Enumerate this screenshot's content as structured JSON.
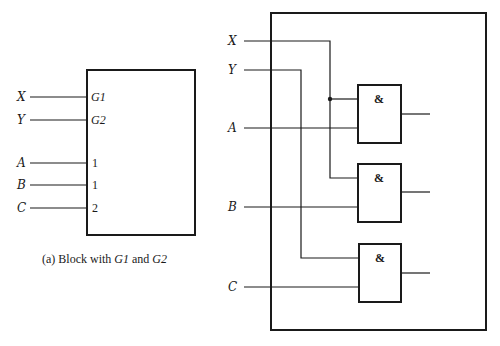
{
  "block_a": {
    "inputs": [
      {
        "label": "X",
        "pin": "G1",
        "pin_suffix": "1",
        "pin_prefix": "G"
      },
      {
        "label": "Y",
        "pin": "G2",
        "pin_suffix": "2",
        "pin_prefix": "G"
      },
      {
        "label": "A",
        "pin": "1"
      },
      {
        "label": "B",
        "pin": "1"
      },
      {
        "label": "C",
        "pin": "2"
      }
    ],
    "caption": {
      "prefix": "(a)  Block with ",
      "g1": "G1",
      "middle": " and ",
      "g2": "G2"
    }
  },
  "block_b": {
    "inputs": [
      {
        "label": "X"
      },
      {
        "label": "Y"
      },
      {
        "label": "A"
      },
      {
        "label": "B"
      },
      {
        "label": "C"
      }
    ],
    "gates": [
      {
        "symbol": "&",
        "inputs": [
          "X",
          "A"
        ]
      },
      {
        "symbol": "&",
        "inputs": [
          "X",
          "B"
        ]
      },
      {
        "symbol": "&",
        "inputs": [
          "Y",
          "C"
        ]
      }
    ]
  },
  "colors": {
    "line": "#1a1a1a",
    "background": "#ffffff"
  }
}
